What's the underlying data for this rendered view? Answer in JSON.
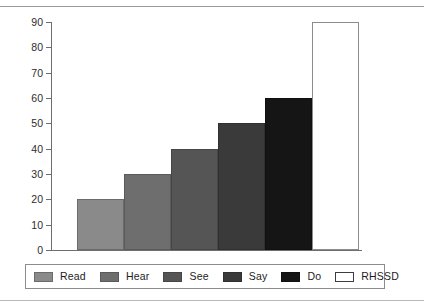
{
  "chart_data": {
    "type": "bar",
    "title": "",
    "xlabel": "",
    "ylabel": "",
    "categories": [
      "Read",
      "Hear",
      "See",
      "Say",
      "Do",
      "RHSSD"
    ],
    "values": [
      20,
      30,
      40,
      50,
      60,
      90
    ],
    "ylim": [
      0,
      90
    ],
    "ytick_values": [
      0,
      10,
      20,
      30,
      40,
      50,
      60,
      70,
      80,
      90
    ],
    "ytick_labels": [
      "0",
      "10",
      "20",
      "30",
      "40",
      "50",
      "60",
      "70",
      "80",
      "90"
    ],
    "grid": false,
    "legend_position": "bottom",
    "bar_gap": 0,
    "series": [
      {
        "name": "",
        "values": [
          20,
          30,
          40,
          50,
          60,
          90
        ]
      }
    ],
    "colors": [
      "#8a8a8a",
      "#6e6e6e",
      "#555555",
      "#3a3a3a",
      "#151515",
      "#ffffff"
    ],
    "bar_border_colors": [
      "#6b6b6b",
      "#5a5a5a",
      "#464646",
      "#303030",
      "#101010",
      "#8c8c8c"
    ]
  },
  "legend": {
    "items": [
      {
        "label": "Read",
        "color": "#8a8a8a",
        "border": "#6b6b6b"
      },
      {
        "label": "Hear",
        "color": "#6e6e6e",
        "border": "#5a5a5a"
      },
      {
        "label": "See",
        "color": "#555555",
        "border": "#464646"
      },
      {
        "label": "Say",
        "color": "#3a3a3a",
        "border": "#303030"
      },
      {
        "label": "Do",
        "color": "#151515",
        "border": "#101010"
      },
      {
        "label": "RHSSD",
        "color": "#ffffff",
        "border": "#3d3d3d"
      }
    ]
  },
  "axes": {
    "axis_color": "#6e6e6e",
    "tick_label_color": "#2d2d2d"
  }
}
